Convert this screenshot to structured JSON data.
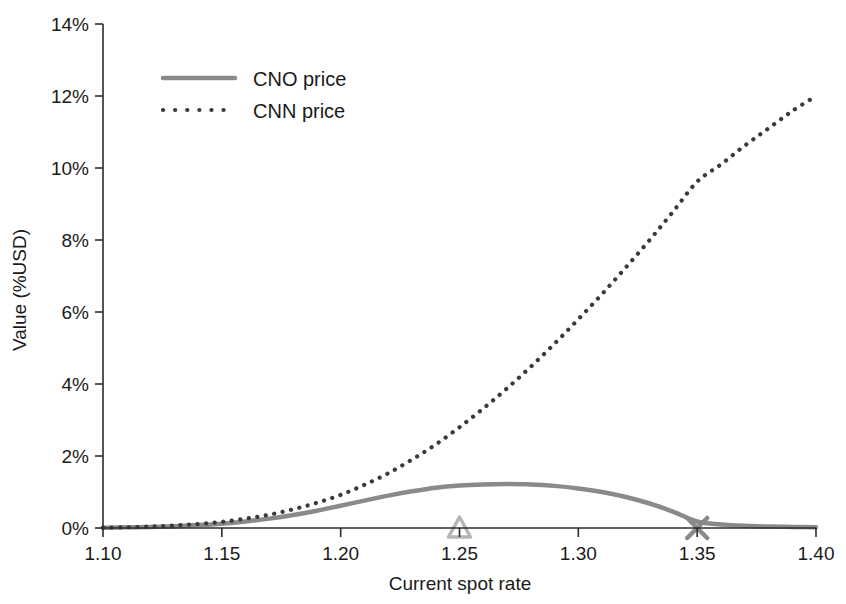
{
  "chart_data": {
    "type": "line",
    "title": "",
    "xlabel": "Current spot rate",
    "ylabel": "Value (%USD)",
    "xlim": [
      1.1,
      1.4
    ],
    "ylim": [
      0,
      14
    ],
    "grid": false,
    "legend_position": "top-left",
    "x_ticks": [
      "1.10",
      "1.15",
      "1.20",
      "1.25",
      "1.30",
      "1.35",
      "1.40"
    ],
    "x_tick_values": [
      1.1,
      1.15,
      1.2,
      1.25,
      1.3,
      1.35,
      1.4
    ],
    "y_ticks": [
      "0%",
      "2%",
      "4%",
      "6%",
      "8%",
      "10%",
      "12%",
      "14%"
    ],
    "y_tick_values": [
      0,
      2,
      4,
      6,
      8,
      10,
      12,
      14
    ],
    "x": [
      1.1,
      1.11,
      1.12,
      1.13,
      1.14,
      1.15,
      1.16,
      1.17,
      1.18,
      1.19,
      1.2,
      1.21,
      1.22,
      1.23,
      1.24,
      1.25,
      1.26,
      1.27,
      1.28,
      1.29,
      1.3,
      1.31,
      1.32,
      1.33,
      1.34,
      1.35,
      1.36,
      1.37,
      1.38,
      1.39,
      1.4
    ],
    "series": [
      {
        "name": "CNO price",
        "style": "solid",
        "color": "#8a8a8a",
        "width": 4.5,
        "values": [
          0.01,
          0.02,
          0.03,
          0.05,
          0.08,
          0.12,
          0.18,
          0.26,
          0.36,
          0.48,
          0.62,
          0.76,
          0.9,
          1.02,
          1.12,
          1.18,
          1.21,
          1.22,
          1.21,
          1.17,
          1.1,
          1.0,
          0.86,
          0.68,
          0.45,
          0.18,
          0.1,
          0.06,
          0.04,
          0.03,
          0.02
        ]
      },
      {
        "name": "CNN price",
        "style": "dotted",
        "color": "#3a3a3a",
        "width": 4.2,
        "values": [
          0.01,
          0.02,
          0.04,
          0.07,
          0.11,
          0.17,
          0.26,
          0.37,
          0.52,
          0.7,
          0.92,
          1.2,
          1.52,
          1.9,
          2.32,
          2.8,
          3.32,
          3.88,
          4.48,
          5.12,
          5.8,
          6.5,
          7.24,
          8.0,
          8.8,
          9.62,
          10.1,
          10.62,
          11.1,
          11.58,
          12.0
        ]
      }
    ],
    "markers": [
      {
        "name": "triangle-marker",
        "shape": "triangle",
        "x": 1.25,
        "y": 0,
        "color": "#b5b5b5"
      },
      {
        "name": "x-marker",
        "shape": "x",
        "x": 1.35,
        "y": 0,
        "color": "#8a8a8a"
      }
    ],
    "legend": [
      {
        "label": "CNO price",
        "style": "solid",
        "color": "#8a8a8a"
      },
      {
        "label": "CNN price",
        "style": "dotted",
        "color": "#3a3a3a"
      }
    ]
  }
}
